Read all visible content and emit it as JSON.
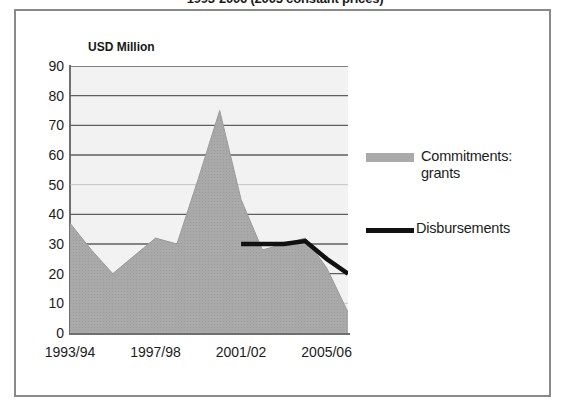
{
  "title": "1993-2006 (2005 constant prices)",
  "unit_label": "USD Million",
  "legend": {
    "items": [
      {
        "label": "Commitments: grants",
        "swatch": "area-swatch",
        "color": "#aaaaaa"
      },
      {
        "label": "Disbursements",
        "swatch": "line-swatch",
        "color": "#111111"
      }
    ]
  },
  "chart_data": {
    "type": "area",
    "title": "1993-2006 (2005 constant prices)",
    "subtitle": "",
    "xlabel": "",
    "ylabel": "USD Million",
    "ylim": [
      0,
      90
    ],
    "y_ticks": [
      0,
      10,
      20,
      30,
      40,
      50,
      60,
      70,
      80,
      90
    ],
    "grid": true,
    "legend_position": "right",
    "categories": [
      "1993/94",
      "1994/95",
      "1995/96",
      "1996/97",
      "1997/98",
      "1998/99",
      "1999/00",
      "2000/01",
      "2001/02",
      "2002/03",
      "2003/04",
      "2004/05",
      "2005/06",
      "2006/07"
    ],
    "x_tick_labels": [
      "1993/94",
      "1997/98",
      "2001/02",
      "2005/06"
    ],
    "x_tick_indices": [
      0,
      4,
      8,
      12
    ],
    "series": [
      {
        "name": "Commitments: grants",
        "type": "area",
        "color": "#aaaaaa",
        "values": [
          37,
          28,
          20,
          26,
          32,
          30,
          52,
          75,
          45,
          28,
          30,
          32,
          22,
          7
        ]
      },
      {
        "name": "Disbursements",
        "type": "line",
        "color": "#111111",
        "values": [
          null,
          null,
          null,
          null,
          null,
          null,
          null,
          null,
          30,
          30,
          30,
          31,
          25,
          20
        ]
      }
    ]
  }
}
